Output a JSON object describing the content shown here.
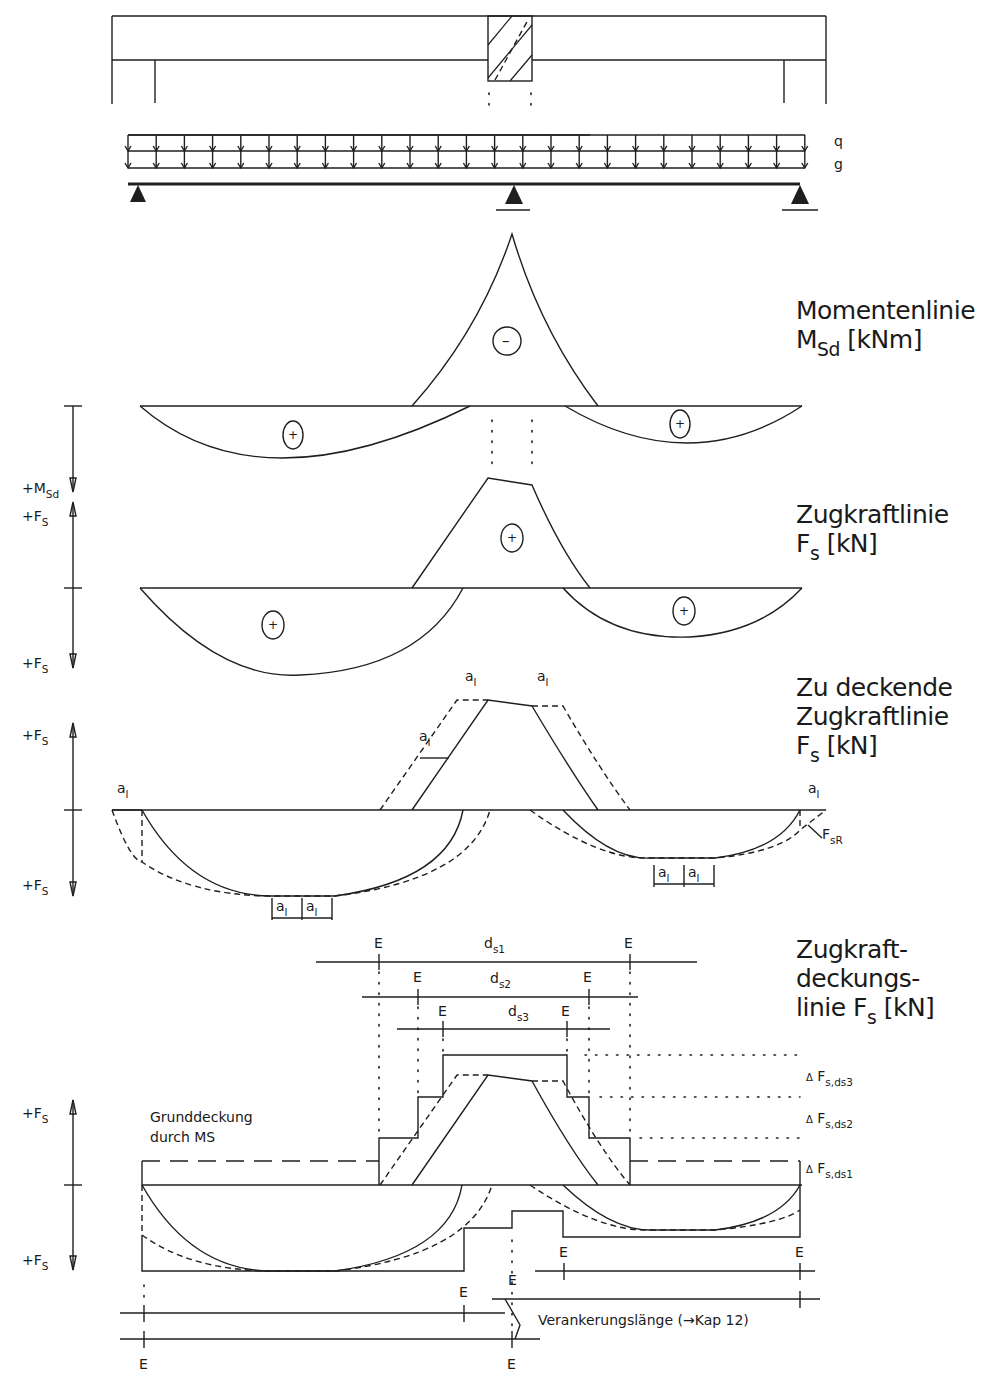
{
  "load_labels": {
    "q": "q",
    "g": "g"
  },
  "sections": {
    "moment": {
      "title_line1": "Momentenlinie",
      "symbol": "M",
      "symbol_sub": "Sd",
      "unit": "[kNm]",
      "sign_span_left": "+",
      "sign_support": "–",
      "sign_span_right": "+"
    },
    "tension": {
      "title_line1": "Zugkraftlinie",
      "symbol": "F",
      "symbol_sub": "s",
      "unit": "[kN]",
      "sign_span_left": "+",
      "sign_support": "+",
      "sign_span_right": "+"
    },
    "to_cover": {
      "title_line1": "Zu deckende",
      "title_line2": "Zugkraftlinie",
      "symbol": "F",
      "symbol_sub": "s",
      "unit": "[kN]",
      "shift_label": "a",
      "shift_sub": "l",
      "fsr_label": "F",
      "fsr_sub": "sR"
    },
    "coverage": {
      "title_line1": "Zugkraft-",
      "title_line2": "deckungs-",
      "title_line3": "linie",
      "symbol": "F",
      "symbol_sub": "s",
      "unit": "[kN]",
      "bars": [
        {
          "label": "d",
          "sub": "s1"
        },
        {
          "label": "d",
          "sub": "s2"
        },
        {
          "label": "d",
          "sub": "s3"
        }
      ],
      "end_marker": "E",
      "delta_labels": [
        {
          "prefix": "Δ",
          "label": "F",
          "sub": "s,ds3"
        },
        {
          "prefix": "Δ",
          "label": "F",
          "sub": "s,ds2"
        },
        {
          "prefix": "Δ",
          "label": "F",
          "sub": "s,ds1"
        }
      ],
      "base_cover_line1": "Grunddeckung",
      "base_cover_line2": "durch MS",
      "anchorage_note": "Verankerungslänge (→Kap 12)"
    }
  },
  "axis_labels": {
    "msd": {
      "prefix": "+M",
      "sub": "Sd"
    },
    "fs": {
      "prefix": "+F",
      "sub": "S"
    }
  }
}
